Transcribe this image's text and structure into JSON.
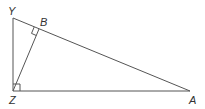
{
  "diagram": {
    "type": "right-triangle-with-altitude",
    "points": {
      "Y": {
        "label": "Y",
        "x": 13,
        "y": 18,
        "lx": 8,
        "ly": 15
      },
      "B": {
        "label": "B",
        "x": 39,
        "y": 29,
        "lx": 40,
        "ly": 26
      },
      "Z": {
        "label": "Z",
        "x": 13,
        "y": 91,
        "lx": 9,
        "ly": 104
      },
      "A": {
        "label": "A",
        "x": 190,
        "y": 91,
        "lx": 189,
        "ly": 104
      }
    },
    "segments": [
      "YZ",
      "ZA",
      "YA",
      "ZB"
    ],
    "right_angles": [
      "Z",
      "B"
    ],
    "line_color": "#555555",
    "label_color": "#333333"
  }
}
